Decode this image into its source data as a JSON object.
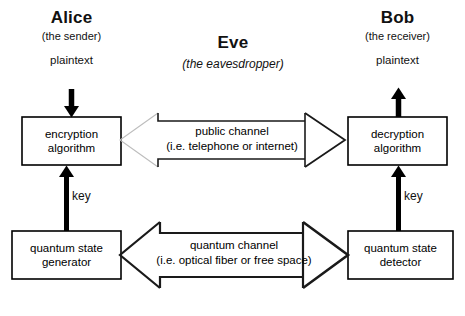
{
  "diagram": {
    "background_color": "#ffffff",
    "stroke_color": "#000000",
    "faint_stroke_color": "#b9b9b9"
  },
  "parties": {
    "alice": {
      "name": "Alice",
      "role": "(the sender)",
      "input_label": "plaintext",
      "key_label": "key"
    },
    "eve": {
      "name": "Eve",
      "role": "(the eavesdropper)"
    },
    "bob": {
      "name": "Bob",
      "role": "(the receiver)",
      "output_label": "plaintext",
      "key_label": "key"
    }
  },
  "boxes": {
    "encryption": {
      "line1": "encryption",
      "line2": "algorithm"
    },
    "decryption": {
      "line1": "decryption",
      "line2": "algorithm"
    },
    "generator": {
      "line1": "quantum state",
      "line2": "generator"
    },
    "detector": {
      "line1": "quantum state",
      "line2": "detector"
    }
  },
  "channels": {
    "public": {
      "line1": "public channel",
      "line2": "(i.e. telephone or internet)"
    },
    "quantum": {
      "line1": "quantum channel",
      "line2": "(i.e. optical fiber or  free space)"
    }
  }
}
